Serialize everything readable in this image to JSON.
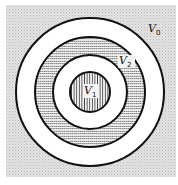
{
  "diagram": {
    "type": "concentric-regions",
    "background_color": "#d9d9d9",
    "center": [
      90,
      92
    ],
    "regions": [
      {
        "name": "V0",
        "label_main": "V",
        "label_sub": "0",
        "description": "outer region (stippled background outside outer ring)"
      },
      {
        "name": "outer-ring",
        "fill": "white",
        "outer_radius": 74,
        "inner_radius": 55
      },
      {
        "name": "V2",
        "label_main": "V",
        "label_sub": "2",
        "fill": "horizontal-hatch",
        "outer_radius": 55,
        "inner_radius": 37
      },
      {
        "name": "inner-ring",
        "fill": "white",
        "outer_radius": 37,
        "inner_radius": 20
      },
      {
        "name": "V1",
        "label_main": "V",
        "label_sub": "1",
        "fill": "vertical-hatch",
        "radius": 20
      }
    ],
    "labels": {
      "v0": {
        "main": "V",
        "sub": "0"
      },
      "v1": {
        "main": "V",
        "sub": "1"
      },
      "v2": {
        "main": "V",
        "sub": "2"
      }
    }
  }
}
